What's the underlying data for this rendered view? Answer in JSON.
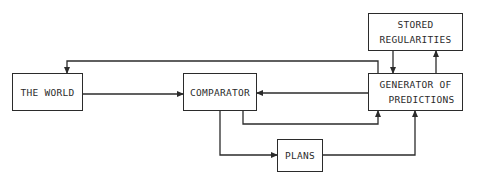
{
  "diagram": {
    "nodes": [
      {
        "id": "world",
        "label_lines": [
          "THE WORLD"
        ]
      },
      {
        "id": "comparator",
        "label_lines": [
          "COMPARATOR"
        ]
      },
      {
        "id": "generator",
        "label_lines": [
          "GENERATOR OF",
          "PREDICTIONS"
        ]
      },
      {
        "id": "stored",
        "label_lines": [
          "STORED",
          "REGULARITIES"
        ]
      },
      {
        "id": "plans",
        "label_lines": [
          "PLANS"
        ]
      }
    ],
    "edges": [
      {
        "from": "world",
        "to": "comparator"
      },
      {
        "from": "generator",
        "to": "comparator"
      },
      {
        "from": "generator",
        "to": "world"
      },
      {
        "from": "comparator",
        "to": "generator"
      },
      {
        "from": "comparator",
        "to": "plans"
      },
      {
        "from": "plans",
        "to": "generator"
      },
      {
        "from": "stored",
        "to": "generator"
      },
      {
        "from": "generator",
        "to": "stored"
      }
    ],
    "colors": {
      "line": "#2b2b2b",
      "background": "#ffffff"
    }
  }
}
